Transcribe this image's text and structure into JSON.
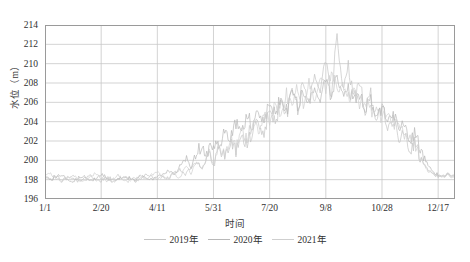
{
  "chart_data": {
    "type": "line",
    "title": "",
    "xlabel": "时间",
    "ylabel": "水位（m）",
    "ylim": [
      196,
      214
    ],
    "yticks": [
      196,
      198,
      200,
      202,
      204,
      206,
      208,
      210,
      212,
      214
    ],
    "xticks": [
      "1/1",
      "2/20",
      "4/11",
      "5/31",
      "7/20",
      "9/8",
      "10/28",
      "12/17"
    ],
    "xtick_positions": [
      0,
      50,
      100,
      150,
      200,
      250,
      300,
      350
    ],
    "xlim": [
      0,
      365
    ],
    "grid": true,
    "legend_position": "bottom",
    "series": [
      {
        "name": "2019年",
        "color": "#c4c4c4",
        "x": [
          0,
          5,
          10,
          15,
          20,
          25,
          30,
          35,
          40,
          45,
          50,
          55,
          60,
          65,
          70,
          75,
          80,
          85,
          90,
          95,
          100,
          105,
          110,
          115,
          120,
          125,
          130,
          135,
          140,
          145,
          150,
          155,
          160,
          165,
          170,
          175,
          180,
          185,
          190,
          195,
          200,
          205,
          210,
          215,
          220,
          225,
          230,
          235,
          240,
          245,
          250,
          255,
          260,
          265,
          270,
          275,
          280,
          285,
          290,
          295,
          300,
          305,
          310,
          315,
          320,
          325,
          330,
          335,
          340,
          345,
          350,
          355,
          360,
          365
        ],
        "values": [
          198.2,
          198.0,
          198.4,
          197.9,
          198.3,
          198.1,
          197.8,
          198.2,
          198.5,
          198.0,
          197.9,
          198.3,
          198.1,
          197.9,
          198.4,
          198.2,
          197.8,
          198.1,
          198.6,
          198.3,
          198.0,
          198.4,
          198.2,
          198.7,
          199.1,
          198.5,
          199.3,
          199.8,
          199.2,
          200.4,
          199.6,
          201.2,
          200.3,
          201.8,
          200.9,
          202.6,
          201.5,
          203.2,
          204.1,
          202.8,
          205.3,
          203.9,
          206.2,
          204.7,
          207.1,
          205.2,
          208.4,
          206.1,
          209.2,
          207.3,
          210.1,
          206.8,
          212.9,
          207.5,
          209.8,
          206.4,
          208.2,
          205.1,
          206.8,
          204.3,
          205.6,
          203.2,
          204.4,
          202.1,
          203.1,
          201.2,
          201.8,
          200.1,
          199.2,
          198.6,
          198.4,
          198.3,
          198.5,
          198.4
        ]
      },
      {
        "name": "2020年",
        "color": "#b8b8b8",
        "x": [
          0,
          5,
          10,
          15,
          20,
          25,
          30,
          35,
          40,
          45,
          50,
          55,
          60,
          65,
          70,
          75,
          80,
          85,
          90,
          95,
          100,
          105,
          110,
          115,
          120,
          125,
          130,
          135,
          140,
          145,
          150,
          155,
          160,
          165,
          170,
          175,
          180,
          185,
          190,
          195,
          200,
          205,
          210,
          215,
          220,
          225,
          230,
          235,
          240,
          245,
          250,
          255,
          260,
          265,
          270,
          275,
          280,
          285,
          290,
          295,
          300,
          305,
          310,
          315,
          320,
          325,
          330,
          335,
          340,
          345,
          350,
          355,
          360,
          365
        ],
        "values": [
          198.1,
          197.9,
          198.3,
          198.5,
          198.0,
          197.7,
          198.2,
          198.4,
          197.9,
          198.1,
          198.6,
          198.2,
          197.8,
          198.0,
          198.3,
          198.1,
          197.9,
          198.5,
          198.2,
          198.0,
          198.3,
          198.6,
          199.0,
          198.4,
          199.5,
          200.2,
          199.3,
          200.8,
          201.4,
          200.5,
          202.1,
          201.3,
          203.0,
          202.2,
          203.8,
          203.1,
          204.5,
          203.6,
          205.2,
          204.3,
          205.8,
          204.9,
          206.4,
          205.1,
          206.9,
          205.6,
          207.3,
          206.0,
          207.8,
          206.3,
          208.1,
          206.7,
          208.6,
          207.0,
          207.4,
          206.2,
          206.8,
          205.4,
          206.1,
          204.8,
          205.3,
          204.1,
          204.8,
          203.4,
          203.9,
          202.3,
          202.8,
          201.0,
          199.8,
          198.8,
          198.5,
          198.4,
          198.6,
          198.5
        ]
      },
      {
        "name": "2021年",
        "color": "#cfcfcf",
        "x": [
          0,
          5,
          10,
          15,
          20,
          25,
          30,
          35,
          40,
          45,
          50,
          55,
          60,
          65,
          70,
          75,
          80,
          85,
          90,
          95,
          100,
          105,
          110,
          115,
          120,
          125,
          130,
          135,
          140,
          145,
          150,
          155,
          160,
          165,
          170,
          175,
          180,
          185,
          190,
          195,
          200,
          205,
          210,
          215,
          220,
          225,
          230,
          235,
          240,
          245,
          250,
          255,
          260,
          265,
          270,
          275,
          280,
          285,
          290,
          295,
          300,
          305,
          310,
          315,
          320,
          325,
          330,
          335,
          340,
          345,
          350,
          355,
          360,
          365
        ],
        "values": [
          198.3,
          198.6,
          198.1,
          197.8,
          198.2,
          198.4,
          198.0,
          197.9,
          198.3,
          198.7,
          198.2,
          197.9,
          198.1,
          198.4,
          198.0,
          197.8,
          198.2,
          198.3,
          198.1,
          198.5,
          198.8,
          198.3,
          198.1,
          198.6,
          198.2,
          199.4,
          198.7,
          199.9,
          199.1,
          200.6,
          199.8,
          201.5,
          200.4,
          202.3,
          201.1,
          203.4,
          202.0,
          204.2,
          203.0,
          205.1,
          203.8,
          206.0,
          204.6,
          206.8,
          205.3,
          207.6,
          205.9,
          208.2,
          206.4,
          208.8,
          206.9,
          209.4,
          207.2,
          208.0,
          206.5,
          207.1,
          205.8,
          206.3,
          205.0,
          205.7,
          204.2,
          204.9,
          203.5,
          204.0,
          202.6,
          203.0,
          201.4,
          200.2,
          199.0,
          198.6,
          198.3,
          198.5,
          198.4,
          198.3
        ]
      }
    ]
  },
  "legend": {
    "items": [
      {
        "label": "2019年"
      },
      {
        "label": "2020年"
      },
      {
        "label": "2021年"
      }
    ]
  },
  "axes": {
    "grid_color": "#c8c8c8",
    "axis_color": "#9a9a9a"
  }
}
